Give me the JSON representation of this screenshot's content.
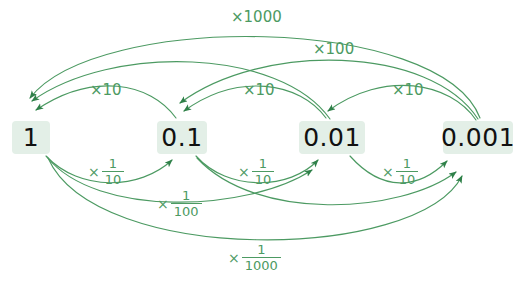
{
  "diagram": {
    "accent_color": "#4c9a62",
    "node_background": "#e3efe7",
    "node_text_color": "#111111",
    "canvas": {
      "width": 516,
      "height": 286
    }
  },
  "nodes": [
    {
      "id": "one",
      "label": "1",
      "x": 12,
      "y": 121,
      "w": 38,
      "h": 33
    },
    {
      "id": "tenth",
      "label": "0.1",
      "x": 157,
      "y": 121,
      "w": 50,
      "h": 33
    },
    {
      "id": "hundredth",
      "label": "0.01",
      "x": 299,
      "y": 121,
      "w": 66,
      "h": 33
    },
    {
      "id": "thousandth",
      "label": "0.001",
      "x": 443,
      "y": 121,
      "w": 70,
      "h": 33
    }
  ],
  "labels": {
    "multiply": [
      {
        "id": "x1000",
        "text": "×1000",
        "x": 231,
        "y": 10
      },
      {
        "id": "x100",
        "text": "×100",
        "x": 313,
        "y": 42
      },
      {
        "id": "x10_a",
        "text": "×10",
        "x": 90,
        "y": 83
      },
      {
        "id": "x10_b",
        "text": "×10",
        "x": 243,
        "y": 83
      },
      {
        "id": "x10_c",
        "text": "×10",
        "x": 392,
        "y": 83
      }
    ],
    "divide": [
      {
        "id": "d10_a",
        "times": "×",
        "numerator": "1",
        "denominator": "10",
        "x": 88,
        "y": 157
      },
      {
        "id": "d10_b",
        "times": "×",
        "numerator": "1",
        "denominator": "10",
        "x": 238,
        "y": 157
      },
      {
        "id": "d10_c",
        "times": "×",
        "numerator": "1",
        "denominator": "10",
        "x": 382,
        "y": 157
      },
      {
        "id": "d100",
        "times": "×",
        "numerator": "1",
        "denominator": "100",
        "x": 157,
        "y": 189
      },
      {
        "id": "d1000",
        "times": "×",
        "numerator": "1",
        "denominator": "1000",
        "x": 228,
        "y": 243
      }
    ]
  },
  "arcs": {
    "multiply_description": "Arcs above the row curve leftward from smaller values to larger values",
    "divide_description": "Arcs below the row curve rightward from larger values to smaller values",
    "edges": [
      {
        "from": "0.1",
        "to": "1",
        "factor": "×10"
      },
      {
        "from": "0.01",
        "to": "0.1",
        "factor": "×10"
      },
      {
        "from": "0.001",
        "to": "0.01",
        "factor": "×10"
      },
      {
        "from": "0.01",
        "to": "1",
        "factor": "×100"
      },
      {
        "from": "0.001",
        "to": "0.1",
        "factor": "×100"
      },
      {
        "from": "0.001",
        "to": "1",
        "factor": "×1000"
      },
      {
        "from": "1",
        "to": "0.1",
        "factor": "×1/10"
      },
      {
        "from": "0.1",
        "to": "0.01",
        "factor": "×1/10"
      },
      {
        "from": "0.01",
        "to": "0.001",
        "factor": "×1/10"
      },
      {
        "from": "1",
        "to": "0.01",
        "factor": "×1/100"
      },
      {
        "from": "0.1",
        "to": "0.001",
        "factor": "×1/100"
      },
      {
        "from": "1",
        "to": "0.001",
        "factor": "×1/1000"
      }
    ]
  }
}
